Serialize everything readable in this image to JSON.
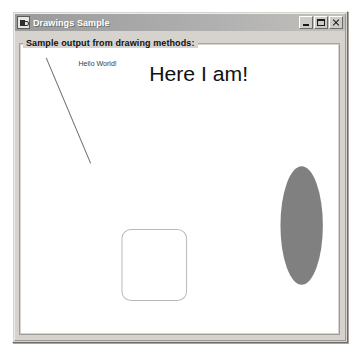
{
  "window": {
    "title": "Drawings Sample",
    "icon": "java-app-icon",
    "controls": {
      "minimize_label": "Minimize",
      "maximize_label": "Maximize",
      "close_label": "Close"
    }
  },
  "panel": {
    "border_title": "Sample output from drawing methods:"
  },
  "canvas": {
    "background_color": "#ffffff",
    "shapes": [
      {
        "name": "diagonal-line",
        "type": "line",
        "x1": 24,
        "y1": 12,
        "x2": 68,
        "y2": 119,
        "stroke": "#6b6b6b",
        "stroke_width": 1
      },
      {
        "name": "hello-world-text",
        "type": "text",
        "value": "Hello World!",
        "x": 56,
        "y": 20,
        "font_size": 7,
        "fill": "#3a3a3a"
      },
      {
        "name": "here-i-am-text",
        "type": "text",
        "value": "Here I am!",
        "x": 126,
        "y": 35,
        "font_size": 21,
        "fill": "#111111"
      },
      {
        "name": "rounded-rectangle",
        "type": "rounded-rect",
        "x": 99,
        "y": 186,
        "width": 64,
        "height": 72,
        "rx": 9,
        "stroke": "#b9b9b9",
        "fill": "none"
      },
      {
        "name": "filled-ellipse",
        "type": "ellipse",
        "cx": 277,
        "cy": 182,
        "rx": 21,
        "ry": 60,
        "fill": "#808080"
      }
    ]
  },
  "colors": {
    "window_face": "#d6d3ce",
    "titlebar_start": "#9a9a9a",
    "titlebar_end": "#c2c0bc",
    "ellipse_gray": "#808080",
    "line_gray": "#6b6b6b",
    "rect_outline": "#b9b9b9"
  }
}
